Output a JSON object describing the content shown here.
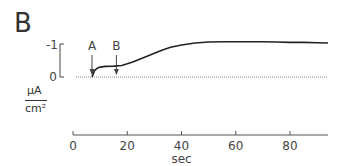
{
  "panel": {
    "label": "B"
  },
  "chart_data": {
    "type": "line",
    "title": "",
    "xlabel": "sec",
    "ylabel_num": "μA",
    "ylabel_den": "cm²",
    "xlim": [
      0,
      94
    ],
    "x_ticks": [
      "0",
      "20",
      "40",
      "60",
      "80"
    ],
    "y_scale_bar": {
      "top_label": "0",
      "bottom_label": "-1"
    },
    "annotations": [
      {
        "label": "A",
        "x": 7,
        "type": "arrow"
      },
      {
        "label": "B",
        "x": 16,
        "type": "arrow"
      }
    ],
    "reference_line": {
      "y": 0,
      "style": "dotted"
    },
    "grid": false,
    "series": [
      {
        "name": "current",
        "x": [
          7,
          8,
          9,
          10,
          12,
          15,
          18,
          20,
          22,
          25,
          28,
          30,
          33,
          36,
          40,
          45,
          50,
          55,
          60,
          65,
          70,
          75,
          80,
          85,
          90,
          94
        ],
        "y": [
          0,
          -0.2,
          -0.27,
          -0.3,
          -0.32,
          -0.33,
          -0.35,
          -0.4,
          -0.45,
          -0.55,
          -0.65,
          -0.72,
          -0.82,
          -0.9,
          -0.97,
          -1.03,
          -1.06,
          -1.07,
          -1.07,
          -1.07,
          -1.07,
          -1.06,
          -1.05,
          -1.05,
          -1.04,
          -1.03
        ]
      }
    ]
  }
}
